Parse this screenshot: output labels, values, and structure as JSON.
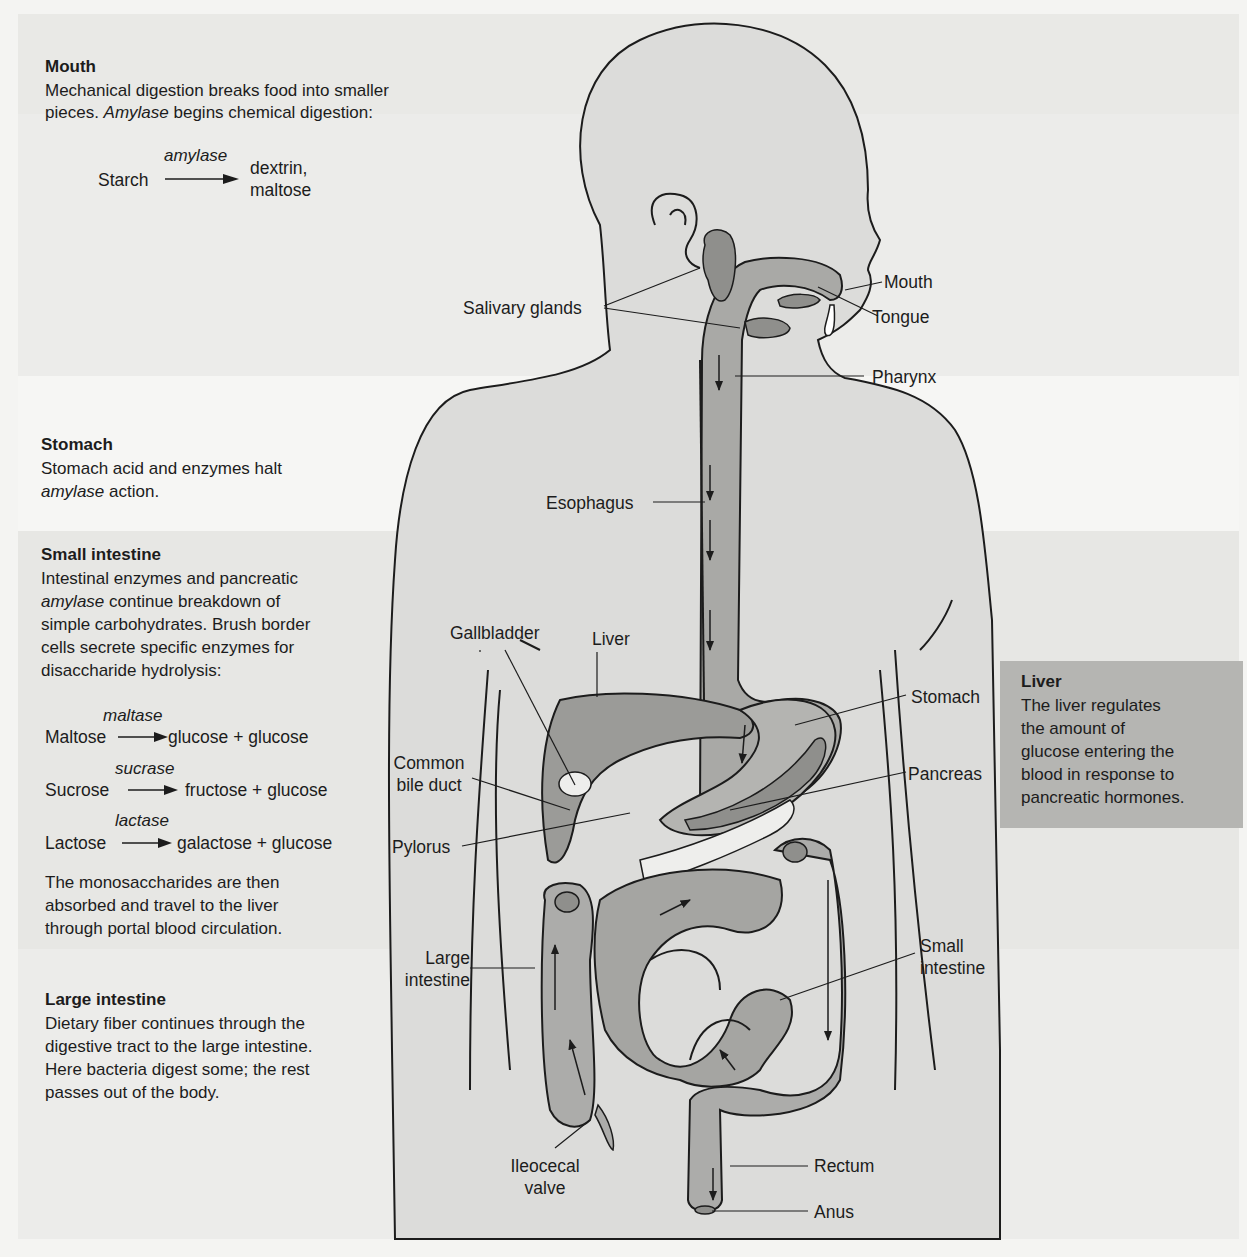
{
  "figure": {
    "type": "digestive-system-carbohydrate-digestion",
    "colors": {
      "background": "#f4f4f2",
      "band_dark": "#e7e7e4",
      "liver_box": "#b5b5b2",
      "body_fill": "#dcdcda",
      "organ_fill": "#a9a9a6",
      "outline": "#1c1c1c"
    }
  },
  "panels": {
    "mouth": {
      "title": "Mouth",
      "text_1": "Mechanical digestion breaks food into smaller",
      "text_2a": "pieces. ",
      "text_2b": "Amylase",
      "text_2c": " begins chemical digestion:",
      "reaction": {
        "substrate": "Starch",
        "enzyme": "amylase",
        "product_1": "dextrin,",
        "product_2": "maltose"
      }
    },
    "stomach": {
      "title": "Stomach",
      "text_1": "Stomach acid and enzymes halt",
      "text_2a": "amylase",
      "text_2b": " action."
    },
    "small_intestine": {
      "title": "Small intestine",
      "text_1": "Intestinal enzymes and pancreatic",
      "text_2a": "amylase",
      "text_2b": " continue breakdown of",
      "text_3": "simple carbohydrates. Brush border",
      "text_4": "cells secrete specific enzymes for",
      "text_5": "disaccharide hydrolysis:",
      "reactions": [
        {
          "enzyme": "maltase",
          "substrate": "Maltose",
          "products": "glucose  + glucose"
        },
        {
          "enzyme": "sucrase",
          "substrate": "Sucrose",
          "products": "fructose + glucose"
        },
        {
          "enzyme": "lactase",
          "substrate": "Lactose",
          "products": "galactose + glucose"
        }
      ],
      "after_1": "The monosaccharides are then",
      "after_2": "absorbed and travel to the liver",
      "after_3": "through portal blood circulation."
    },
    "large_intestine": {
      "title": "Large intestine",
      "text_1": "Dietary fiber continues through the",
      "text_2": "digestive tract to the large intestine.",
      "text_3": "Here bacteria digest some; the rest",
      "text_4": "passes out of the body."
    },
    "liver": {
      "title": "Liver",
      "text_1": "The liver regulates",
      "text_2": "the amount of",
      "text_3": "glucose entering the",
      "text_4": "blood in response to",
      "text_5": "pancreatic hormones."
    }
  },
  "labels": {
    "mouth": "Mouth",
    "tongue": "Tongue",
    "salivary_glands": "Salivary glands",
    "pharynx": "Pharynx",
    "esophagus": "Esophagus",
    "gallbladder": "Gallbladder",
    "liver": "Liver",
    "stomach": "Stomach",
    "common_bile_duct_1": "Common",
    "common_bile_duct_2": "bile duct",
    "pancreas": "Pancreas",
    "pylorus": "Pylorus",
    "large_intestine_1": "Large",
    "large_intestine_2": "intestine",
    "small_intestine_1": "Small",
    "small_intestine_2": "intestine",
    "ileocecal_valve_1": "Ileocecal",
    "ileocecal_valve_2": "valve",
    "rectum": "Rectum",
    "anus": "Anus"
  }
}
